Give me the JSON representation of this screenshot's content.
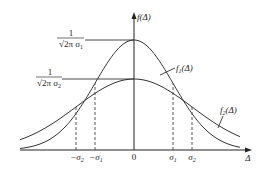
{
  "diagram": {
    "type": "normal-distribution-comparison",
    "y_axis_label": "f(Δ)",
    "x_axis_label": "Δ",
    "origin_label": "0",
    "x_ticks": [
      {
        "label": "−σ",
        "sub": "2",
        "pos": -2
      },
      {
        "label": "−σ",
        "sub": "1",
        "pos": -1
      },
      {
        "label": "σ",
        "sub": "1",
        "pos": 1
      },
      {
        "label": "σ",
        "sub": "2",
        "pos": 2
      }
    ],
    "y_marks": [
      {
        "numerator": "1",
        "denominator": "√2π σ",
        "sub": "1"
      },
      {
        "numerator": "1",
        "denominator": "√2π σ",
        "sub": "2"
      }
    ],
    "curves": [
      {
        "name": "f",
        "sub": "1",
        "arg": "(Δ)",
        "sigma_px": 39,
        "peak_px": 110
      },
      {
        "name": "f",
        "sub": "2",
        "arg": "(Δ)",
        "sigma_px": 58,
        "peak_px": 71
      }
    ],
    "colors": {
      "line": "#333333",
      "background": "#ffffff"
    }
  }
}
